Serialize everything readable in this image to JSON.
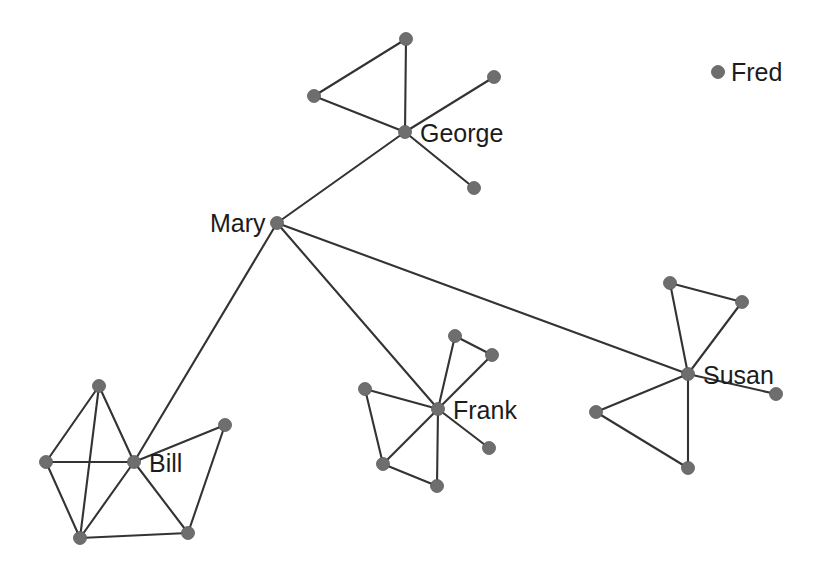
{
  "graph": {
    "title": "Social Network Graph",
    "width": 818,
    "height": 582,
    "background_color": "#ffffff",
    "node_color": "#6e6e6e",
    "edge_color": "#333333",
    "label_color": "#1c1c1c",
    "node_radius": 6.5,
    "hub_radius": 6.5,
    "labeled_people": [
      "Mary",
      "George",
      "Bill",
      "Frank",
      "Susan",
      "Fred"
    ],
    "node_count": 29,
    "edge_count": 39,
    "nodes": [
      {
        "id": "mary",
        "label": "Mary",
        "x": 277,
        "y": 223,
        "label_x": 210,
        "label_y": 232,
        "label_anchor": "start",
        "labeled": true
      },
      {
        "id": "george",
        "label": "George",
        "x": 405,
        "y": 132,
        "label_x": 420,
        "label_y": 142,
        "label_anchor": "start",
        "labeled": true
      },
      {
        "id": "george_a",
        "label": "",
        "x": 406,
        "y": 39,
        "labeled": false
      },
      {
        "id": "george_b",
        "label": "",
        "x": 314,
        "y": 96,
        "labeled": false
      },
      {
        "id": "george_c",
        "label": "",
        "x": 494,
        "y": 77,
        "labeled": false
      },
      {
        "id": "george_d",
        "label": "",
        "x": 474,
        "y": 188,
        "labeled": false
      },
      {
        "id": "bill",
        "label": "Bill",
        "x": 134,
        "y": 462,
        "label_x": 149,
        "label_y": 472,
        "label_anchor": "start",
        "labeled": true
      },
      {
        "id": "bill_t",
        "label": "",
        "x": 99,
        "y": 386,
        "labeled": false
      },
      {
        "id": "bill_l",
        "label": "",
        "x": 46,
        "y": 462,
        "labeled": false
      },
      {
        "id": "bill_bl",
        "label": "",
        "x": 80,
        "y": 538,
        "labeled": false
      },
      {
        "id": "bill_r",
        "label": "",
        "x": 225,
        "y": 425,
        "labeled": false
      },
      {
        "id": "bill_br",
        "label": "",
        "x": 188,
        "y": 533,
        "labeled": false
      },
      {
        "id": "frank",
        "label": "Frank",
        "x": 438,
        "y": 409,
        "label_x": 453,
        "label_y": 419,
        "label_anchor": "start",
        "labeled": true
      },
      {
        "id": "frank_a",
        "label": "",
        "x": 455,
        "y": 336,
        "labeled": false
      },
      {
        "id": "frank_b",
        "label": "",
        "x": 492,
        "y": 355,
        "labeled": false
      },
      {
        "id": "frank_c",
        "label": "",
        "x": 365,
        "y": 389,
        "labeled": false
      },
      {
        "id": "frank_d",
        "label": "",
        "x": 383,
        "y": 464,
        "labeled": false
      },
      {
        "id": "frank_e",
        "label": "",
        "x": 437,
        "y": 486,
        "labeled": false
      },
      {
        "id": "frank_g",
        "label": "",
        "x": 489,
        "y": 448,
        "labeled": false
      },
      {
        "id": "susan",
        "label": "Susan",
        "x": 688,
        "y": 374,
        "label_x": 703,
        "label_y": 384,
        "label_anchor": "start",
        "labeled": true
      },
      {
        "id": "susan_p",
        "label": "",
        "x": 670,
        "y": 283,
        "labeled": false
      },
      {
        "id": "susan_q",
        "label": "",
        "x": 742,
        "y": 302,
        "labeled": false
      },
      {
        "id": "susan_r",
        "label": "",
        "x": 596,
        "y": 412,
        "labeled": false
      },
      {
        "id": "susan_t",
        "label": "",
        "x": 688,
        "y": 468,
        "labeled": false
      },
      {
        "id": "susan_u",
        "label": "",
        "x": 776,
        "y": 394,
        "labeled": false
      }
    ],
    "edges": [
      {
        "from": "mary",
        "to": "george"
      },
      {
        "from": "mary",
        "to": "bill"
      },
      {
        "from": "mary",
        "to": "frank"
      },
      {
        "from": "mary",
        "to": "susan"
      },
      {
        "from": "george",
        "to": "george_a"
      },
      {
        "from": "george",
        "to": "george_b"
      },
      {
        "from": "george",
        "to": "george_c"
      },
      {
        "from": "george",
        "to": "george_d"
      },
      {
        "from": "george_a",
        "to": "george_b"
      },
      {
        "from": "bill",
        "to": "bill_t"
      },
      {
        "from": "bill",
        "to": "bill_l"
      },
      {
        "from": "bill",
        "to": "bill_bl"
      },
      {
        "from": "bill",
        "to": "bill_r"
      },
      {
        "from": "bill",
        "to": "bill_br"
      },
      {
        "from": "bill_t",
        "to": "bill_l"
      },
      {
        "from": "bill_t",
        "to": "bill_bl"
      },
      {
        "from": "bill_l",
        "to": "bill_bl"
      },
      {
        "from": "bill_bl",
        "to": "bill_br"
      },
      {
        "from": "bill_r",
        "to": "bill_br"
      },
      {
        "from": "frank",
        "to": "frank_a"
      },
      {
        "from": "frank",
        "to": "frank_b"
      },
      {
        "from": "frank",
        "to": "frank_c"
      },
      {
        "from": "frank",
        "to": "frank_d"
      },
      {
        "from": "frank",
        "to": "frank_e"
      },
      {
        "from": "frank",
        "to": "frank_g"
      },
      {
        "from": "frank_a",
        "to": "frank_b"
      },
      {
        "from": "frank_c",
        "to": "frank_d"
      },
      {
        "from": "frank_d",
        "to": "frank_e"
      },
      {
        "from": "susan",
        "to": "susan_p"
      },
      {
        "from": "susan",
        "to": "susan_q"
      },
      {
        "from": "susan",
        "to": "susan_r"
      },
      {
        "from": "susan",
        "to": "susan_t"
      },
      {
        "from": "susan",
        "to": "susan_u"
      },
      {
        "from": "susan_p",
        "to": "susan_q"
      },
      {
        "from": "susan_r",
        "to": "susan_t"
      }
    ]
  },
  "legend": {
    "label": "Fred",
    "dot_x": 718,
    "dot_y": 72,
    "dot_radius": 6.5,
    "label_x": 731,
    "label_y": 81
  }
}
